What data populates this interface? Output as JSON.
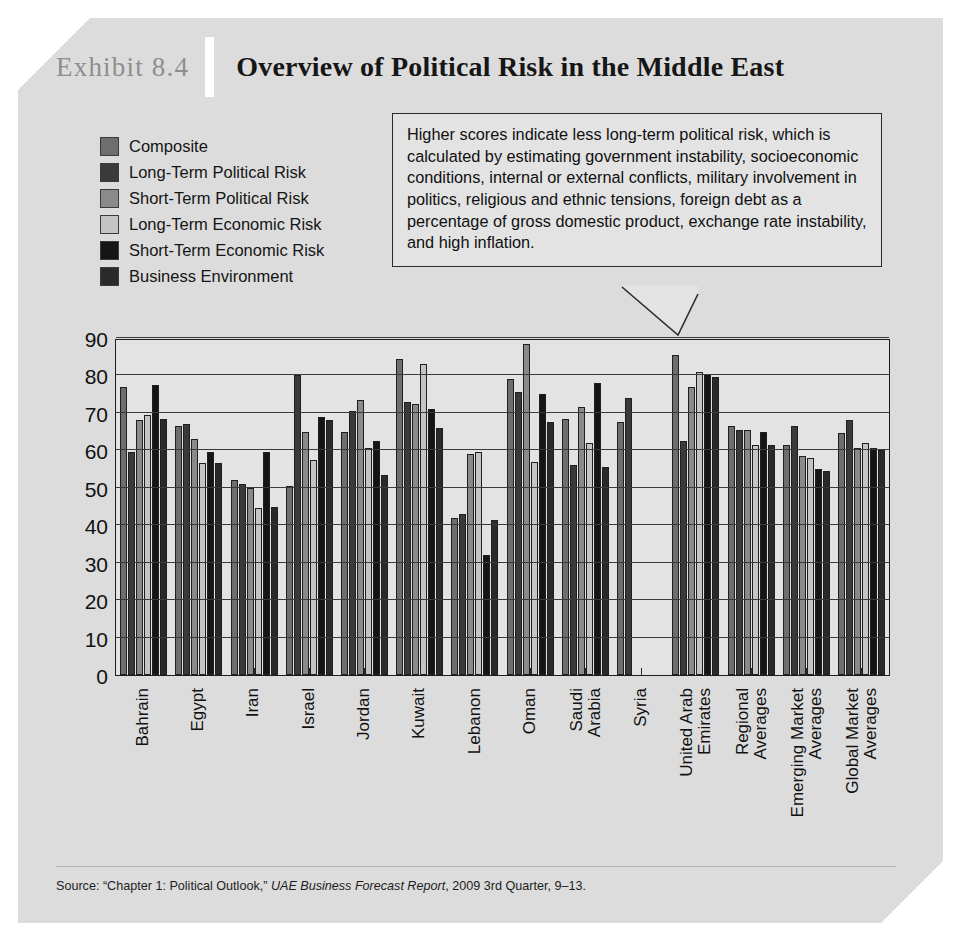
{
  "exhibit": {
    "number": "Exhibit 8.4",
    "title": "Overview of Political Risk in the Middle East",
    "source": "Source: “Chapter 1: Political Outlook,” ",
    "source_italic": "UAE Business Forecast Report",
    "source_tail": ", 2009 3rd Quarter, 9–13."
  },
  "callout": {
    "text": "Higher scores indicate less long-term political risk, which is calculated by estimating government instability, socioeconomic conditions, internal or external conflicts, military involvement in politics, religious and ethnic tensions, foreign debt as a percentage of gross domestic product, exchange rate instability, and high inflation."
  },
  "legend": {
    "items": [
      {
        "label": "Composite",
        "color": "#6e6e6e"
      },
      {
        "label": "Long-Term Political Risk",
        "color": "#3a3a3a"
      },
      {
        "label": "Short-Term Political Risk",
        "color": "#8a8a8a"
      },
      {
        "label": "Long-Term Economic Risk",
        "color": "#c4c4c4"
      },
      {
        "label": "Short-Term Economic Risk",
        "color": "#151515"
      },
      {
        "label": "Business Environment",
        "color": "#2a2a2a"
      }
    ]
  },
  "chart_data": {
    "type": "bar",
    "title": "Overview of Political Risk in the Middle East",
    "xlabel": "",
    "ylabel": "",
    "ylim": [
      0,
      90
    ],
    "yticks": [
      0,
      10,
      20,
      30,
      40,
      50,
      60,
      70,
      80,
      90
    ],
    "grid": true,
    "legend_position": "upper-left",
    "categories": [
      "Bahrain",
      "Egypt",
      "Iran",
      "Israel",
      "Jordan",
      "Kuwait",
      "Lebanon",
      "Oman",
      "Saudi Arabia",
      "Syria",
      "United Arab Emirates",
      "Regional Averages",
      "Emerging Market Averages",
      "Global Market Averages"
    ],
    "series": [
      {
        "name": "Composite",
        "color": "#6e6e6e",
        "values": [
          77.0,
          66.5,
          52.0,
          50.5,
          65.0,
          84.5,
          42.0,
          79.0,
          68.5,
          67.5,
          85.5,
          66.5,
          61.5,
          64.5
        ]
      },
      {
        "name": "Long-Term Political Risk",
        "color": "#3a3a3a",
        "values": [
          59.5,
          67.0,
          51.0,
          80.0,
          70.5,
          73.0,
          43.0,
          75.5,
          56.0,
          74.0,
          62.5,
          65.5,
          66.5,
          68.0
        ]
      },
      {
        "name": "Short-Term Political Risk",
        "color": "#8a8a8a",
        "values": [
          68.0,
          63.0,
          50.0,
          65.0,
          73.5,
          72.5,
          59.0,
          88.5,
          71.5,
          0,
          77.0,
          65.5,
          58.5,
          60.5
        ]
      },
      {
        "name": "Long-Term Economic Risk",
        "color": "#c4c4c4",
        "values": [
          69.5,
          56.5,
          44.5,
          57.5,
          60.5,
          83.0,
          59.5,
          57.0,
          62.0,
          0,
          81.0,
          61.5,
          58.0,
          62.0
        ]
      },
      {
        "name": "Short-Term Economic Risk",
        "color": "#151515",
        "values": [
          77.5,
          59.5,
          59.5,
          69.0,
          62.5,
          71.0,
          32.0,
          75.0,
          78.0,
          0,
          80.5,
          65.0,
          55.0,
          60.5
        ]
      },
      {
        "name": "Business Environment",
        "color": "#2a2a2a",
        "values": [
          68.5,
          56.5,
          45.0,
          68.0,
          53.5,
          66.0,
          41.5,
          67.5,
          55.5,
          0,
          79.5,
          61.5,
          54.5,
          60.0
        ]
      }
    ]
  }
}
